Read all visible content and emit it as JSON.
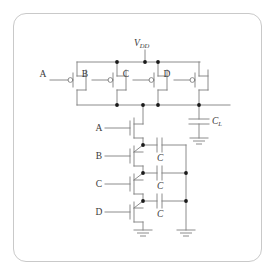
{
  "figure": {
    "kind": "cmos-schematic",
    "frame": {
      "border_color": "#c9c9c9",
      "background": "#ffffff",
      "corner_radius": 13
    },
    "wire_color": "#808080",
    "node_color": "#1a1a1a",
    "text_color": "#3a3a3a"
  },
  "labels": {
    "supply": "V",
    "supply_sub": "DD",
    "load_cap": "C",
    "load_cap_sub": "L",
    "internal_cap": "C",
    "pmos_gate_a": "A",
    "pmos_gate_b": "B",
    "pmos_gate_c": "C",
    "pmos_gate_d": "D",
    "nmos_gate_a": "A",
    "nmos_gate_b": "B",
    "nmos_gate_c": "C",
    "nmos_gate_d": "D"
  },
  "pull_up_network": {
    "type": "pmos-parallel",
    "count": 4,
    "transistors": [
      {
        "gate_label": "A",
        "x": 77
      },
      {
        "gate_label": "B",
        "x": 117
      },
      {
        "gate_label": "C",
        "x": 158
      },
      {
        "gate_label": "D",
        "x": 199
      }
    ],
    "supply_rail_y": 62,
    "output_rail_y": 105
  },
  "pull_down_network": {
    "type": "nmos-series",
    "count": 4,
    "transistors": [
      {
        "gate_label": "A",
        "y": 131
      },
      {
        "gate_label": "B",
        "y": 159
      },
      {
        "gate_label": "C",
        "y": 187
      },
      {
        "gate_label": "D",
        "y": 215
      }
    ],
    "stack_x": 143
  },
  "internal_capacitors": [
    {
      "label": "C",
      "y": 145
    },
    {
      "label": "C",
      "y": 173
    },
    {
      "label": "C",
      "y": 201
    }
  ],
  "load_capacitor": {
    "label": "C",
    "sub": "L",
    "x": 199,
    "y": 124
  },
  "grounds": [
    {
      "name": "ground-load",
      "x": 199,
      "y": 145
    },
    {
      "name": "ground-nmos-stack",
      "x": 143,
      "y": 237
    },
    {
      "name": "ground-cap-rail",
      "x": 186,
      "y": 237
    }
  ]
}
